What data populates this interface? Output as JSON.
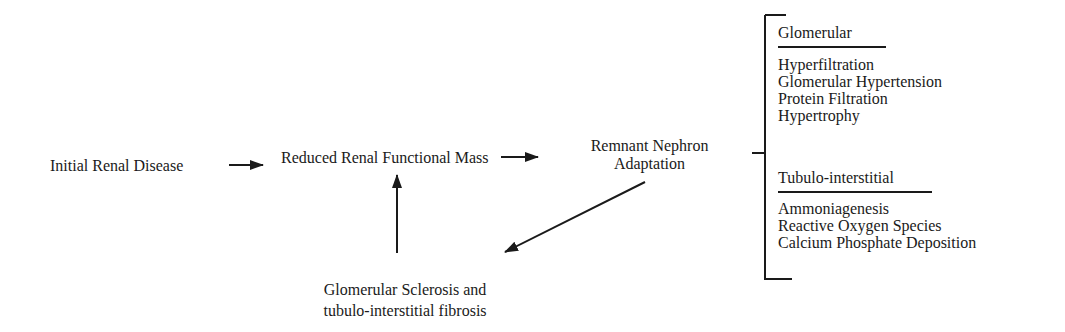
{
  "diagram": {
    "nodes": {
      "initial": "Initial Renal Disease",
      "reduced": "Reduced Renal Functional Mass",
      "remnant_line1": "Remnant Nephron",
      "remnant_line2": "Adaptation",
      "sclerosis_line1": "Glomerular Sclerosis and",
      "sclerosis_line2": "tubulo-interstitial fibrosis"
    },
    "glomerular": {
      "header": "Glomerular",
      "items": [
        "Hyperfiltration",
        "Glomerular Hypertension",
        "Protein Filtration",
        "Hypertrophy"
      ]
    },
    "tubulo": {
      "header": "Tubulo-interstitial",
      "items": [
        "Ammoniagenesis",
        "Reactive Oxygen Species",
        "Calcium Phosphate Deposition"
      ]
    },
    "colors": {
      "ink": "#1a1a1a",
      "background": "#ffffff"
    }
  }
}
